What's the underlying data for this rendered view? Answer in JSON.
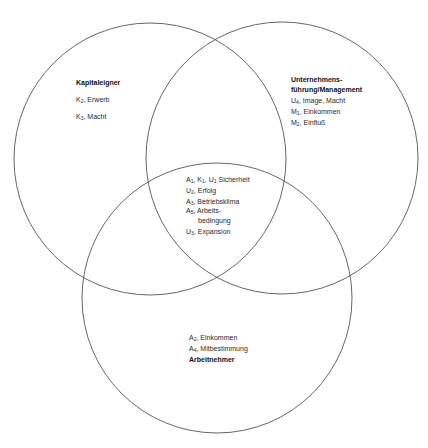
{
  "diagram": {
    "type": "venn",
    "circles": [
      {
        "id": "kapitaleigner",
        "cx": 150,
        "cy": 159,
        "r": 136
      },
      {
        "id": "management",
        "cx": 282,
        "cy": 158,
        "r": 136
      },
      {
        "id": "arbeitnehmer",
        "cx": 217,
        "cy": 298,
        "r": 135
      }
    ],
    "stroke_color": "#555555"
  },
  "kapitaleigner": {
    "title": "Kapitaleigner",
    "items": [
      {
        "sym": "K",
        "sub": "2",
        "text": ", Erwerb"
      },
      {
        "sym": "K",
        "sub": "3",
        "text": ", Macht"
      }
    ]
  },
  "management": {
    "title_line1": "Unternehmens-",
    "title_line2": "führung/Management",
    "items": [
      {
        "sym": "U",
        "sub": "4",
        "text": ", Image, Macht"
      },
      {
        "sym": "M",
        "sub": "1",
        "text": ", Einkommen"
      },
      {
        "sym": "M",
        "sub": "2",
        "text": ", Einfluß"
      }
    ]
  },
  "common": {
    "items": [
      {
        "parts": [
          {
            "sym": "A",
            "sub": "1",
            "text": ", "
          },
          {
            "sym": "K",
            "sub": "1",
            "text": ", "
          },
          {
            "sym": "U",
            "sub": "1",
            "text": " Sicherheit"
          }
        ]
      },
      {
        "sym": "U",
        "sub": "2",
        "text": ", Erfolg"
      },
      {
        "sym": "A",
        "sub": "3",
        "text": ", Betriebsklima"
      },
      {
        "sym": "A",
        "sub": "5",
        "text": ", Arbeits-",
        "cont": "bedingung"
      },
      {
        "sym": "U",
        "sub": "3",
        "text": ", Expansion"
      }
    ]
  },
  "arbeitnehmer": {
    "title": "Arbeitnehmer",
    "items": [
      {
        "sym": "A",
        "sub": "2",
        "text": ", Einkommen"
      },
      {
        "sym": "A",
        "sub": "4",
        "text": ", Mitbestimmung"
      }
    ]
  }
}
